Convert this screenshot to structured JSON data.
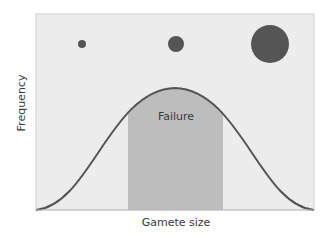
{
  "diagram": {
    "x_axis_label": "Gamete size",
    "y_axis_label": "Frequency",
    "region_label": "Failure",
    "gametes": [
      {
        "size": "small",
        "cx": 82,
        "cy": 44,
        "r": 4
      },
      {
        "size": "medium",
        "cx": 176,
        "cy": 44,
        "r": 8
      },
      {
        "size": "large",
        "cx": 270,
        "cy": 44,
        "r": 19
      }
    ],
    "colors": {
      "panel_bg": "#ececec",
      "panel_border": "#d2d2d2",
      "shaded_region": "#bdbdbd",
      "curve": "#555555",
      "gamete_fill": "#555555"
    }
  }
}
